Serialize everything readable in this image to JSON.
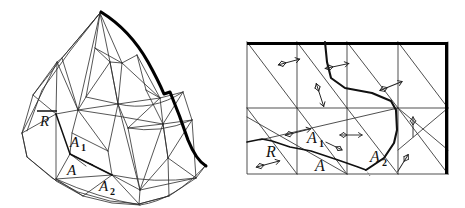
{
  "figure": {
    "background_color": "#ffffff",
    "ink_color": "#111111",
    "thin_stroke_color": "#333333",
    "bold_stroke_color": "#000000",
    "width": 465,
    "height": 208
  },
  "left_panel": {
    "name": "polyhedral-surface-3d",
    "description": "Curved polyhedral cap with triangulated facets and a bold curved right boundary",
    "labels": [
      {
        "id": "R-bar",
        "text": "R",
        "overbar": true,
        "x": 44,
        "y": 124
      },
      {
        "id": "A1",
        "base": "A",
        "sub": "1",
        "x": 75,
        "y": 144
      },
      {
        "id": "A",
        "base": "A",
        "sub": "",
        "x": 72,
        "y": 172
      },
      {
        "id": "A2",
        "base": "A",
        "sub": "2",
        "x": 104,
        "y": 188
      }
    ]
  },
  "right_panel": {
    "name": "planar-development-rectangle",
    "description": "Rectangular development with grid lines, diagonals, a bold polyline boundary and small double-headed arrow markers",
    "rect": {
      "x": 247,
      "y": 42,
      "width": 201,
      "height": 132
    },
    "labels": [
      {
        "id": "R",
        "base": "R",
        "sub": "",
        "x": 272,
        "y": 152
      },
      {
        "id": "A1",
        "base": "A",
        "sub": "1",
        "x": 313,
        "y": 139
      },
      {
        "id": "A",
        "base": "A",
        "sub": "",
        "x": 320,
        "y": 167
      },
      {
        "id": "A2",
        "base": "A",
        "sub": "2",
        "x": 377,
        "y": 158
      }
    ],
    "arrow_markers": [
      {
        "id": "arrow-1",
        "x": 289,
        "y": 62,
        "angle": -15,
        "length": 20
      },
      {
        "id": "arrow-2",
        "x": 334,
        "y": 65,
        "angle": -10,
        "length": 22
      },
      {
        "id": "arrow-3",
        "x": 390,
        "y": 85,
        "angle": -20,
        "length": 22
      },
      {
        "id": "arrow-4",
        "x": 320,
        "y": 95,
        "angle": 70,
        "length": 22
      },
      {
        "id": "arrow-5",
        "x": 298,
        "y": 132,
        "angle": -12,
        "length": 24
      },
      {
        "id": "arrow-6",
        "x": 350,
        "y": 135,
        "angle": 0,
        "length": 20
      },
      {
        "id": "arrow-7",
        "x": 268,
        "y": 164,
        "angle": -14,
        "length": 22
      },
      {
        "id": "arrow-8",
        "x": 413,
        "y": 127,
        "angle": -90,
        "length": 20
      },
      {
        "id": "arrow-9",
        "x": 402,
        "y": 163,
        "angle": -55,
        "length": 20
      }
    ]
  }
}
